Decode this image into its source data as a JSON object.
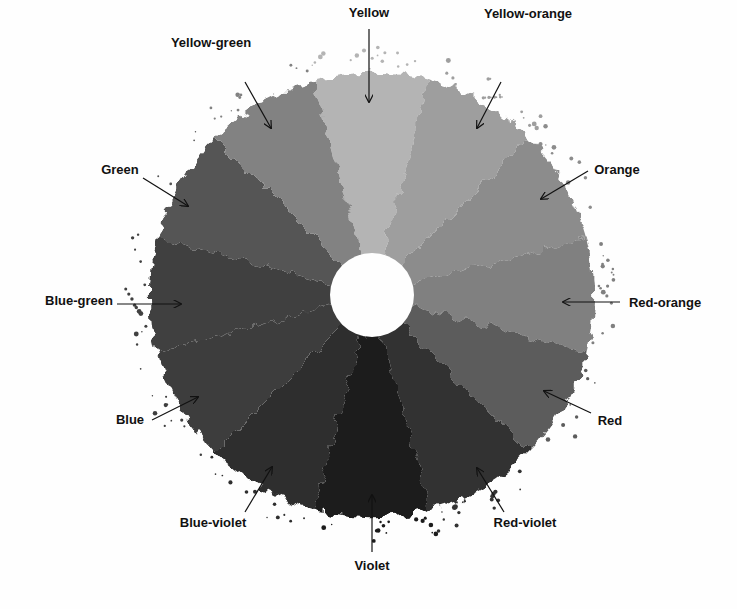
{
  "diagram": {
    "center": [
      372,
      295
    ],
    "outer_radius": 222,
    "inner_radius": 42,
    "background": "#fefefe",
    "segments": [
      {
        "name": "Yellow",
        "angle": 0,
        "fill": "#b4b4b4",
        "label": "Yellow",
        "label_xy": [
          369,
          17
        ],
        "anchor": "middle",
        "arrow": [
          [
            369,
            29
          ],
          [
            369,
            102
          ]
        ]
      },
      {
        "name": "Yellow-orange",
        "angle": 30,
        "fill": "#9e9e9e",
        "label": "Yellow-orange",
        "label_xy": [
          528,
          18
        ],
        "anchor": "middle",
        "arrow": [
          [
            501,
            82
          ],
          [
            477,
            128
          ]
        ]
      },
      {
        "name": "Orange",
        "angle": 60,
        "fill": "#8c8c8c",
        "label": "Orange",
        "label_xy": [
          617,
          174
        ],
        "anchor": "middle",
        "arrow": [
          [
            588,
            171
          ],
          [
            541,
            199
          ]
        ]
      },
      {
        "name": "Red-orange",
        "angle": 90,
        "fill": "#808080",
        "label": "Red-orange",
        "label_xy": [
          665,
          307
        ],
        "anchor": "middle",
        "arrow": [
          [
            620,
            302
          ],
          [
            563,
            302
          ]
        ]
      },
      {
        "name": "Red",
        "angle": 120,
        "fill": "#5c5c5c",
        "label": "Red",
        "label_xy": [
          610,
          425
        ],
        "anchor": "middle",
        "arrow": [
          [
            591,
            413
          ],
          [
            544,
            391
          ]
        ]
      },
      {
        "name": "Red-violet",
        "angle": 150,
        "fill": "#333333",
        "label": "Red-violet",
        "label_xy": [
          525,
          527
        ],
        "anchor": "middle",
        "arrow": [
          [
            504,
            512
          ],
          [
            477,
            468
          ]
        ]
      },
      {
        "name": "Violet",
        "angle": 180,
        "fill": "#1b1b1b",
        "label": "Violet",
        "label_xy": [
          372,
          570
        ],
        "anchor": "middle",
        "arrow": [
          [
            372,
            552
          ],
          [
            372,
            495
          ]
        ]
      },
      {
        "name": "Blue-violet",
        "angle": 210,
        "fill": "#2e2e2e",
        "label": "Blue-violet",
        "label_xy": [
          213,
          527
        ],
        "anchor": "middle",
        "arrow": [
          [
            245,
            512
          ],
          [
            272,
            467
          ]
        ]
      },
      {
        "name": "Blue",
        "angle": 240,
        "fill": "#3e3e3e",
        "label": "Blue",
        "label_xy": [
          130,
          424
        ],
        "anchor": "middle",
        "arrow": [
          [
            152,
            420
          ],
          [
            198,
            397
          ]
        ]
      },
      {
        "name": "Blue-green",
        "angle": 270,
        "fill": "#404040",
        "label": "Blue-green",
        "label_xy": [
          79,
          305
        ],
        "anchor": "middle",
        "arrow": [
          [
            117,
            304
          ],
          [
            181,
            304
          ]
        ]
      },
      {
        "name": "Green",
        "angle": 300,
        "fill": "#545454",
        "label": "Green",
        "label_xy": [
          120,
          174
        ],
        "anchor": "middle",
        "arrow": [
          [
            143,
            178
          ],
          [
            188,
            206
          ]
        ]
      },
      {
        "name": "Yellow-green",
        "angle": 330,
        "fill": "#828282",
        "label": "Yellow-green",
        "label_xy": [
          211,
          47
        ],
        "anchor": "middle",
        "arrow": [
          [
            245,
            82
          ],
          [
            271,
            128
          ]
        ]
      }
    ]
  }
}
